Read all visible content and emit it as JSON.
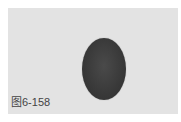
{
  "figure": {
    "caption": "图6-158",
    "background_color": "#e3e3e3",
    "shape": {
      "type": "ellipse",
      "color": "#3a3a3a"
    }
  }
}
